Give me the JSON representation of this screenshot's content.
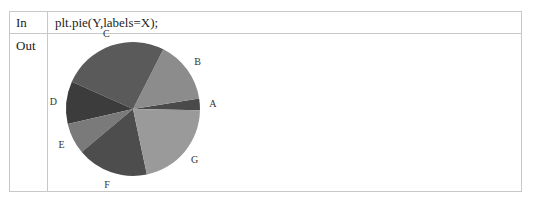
{
  "cells": {
    "in_label": "In",
    "in_code": "plt.pie(Y,labels=X);",
    "out_label": "Out"
  },
  "chart_data": {
    "type": "pie",
    "title": "",
    "labels": [
      "A",
      "B",
      "C",
      "D",
      "E",
      "F",
      "G"
    ],
    "values": [
      2.8,
      15.0,
      25.8,
      10.3,
      7.5,
      17.2,
      21.4
    ],
    "start_angle_deg": -1,
    "direction": "counterclockwise",
    "colors": [
      "#4a4a4a",
      "#8c8c8c",
      "#5a5a5a",
      "#3c3c3c",
      "#7a7a7a",
      "#4d4d4d",
      "#9a9a9a"
    ],
    "legend": false
  }
}
